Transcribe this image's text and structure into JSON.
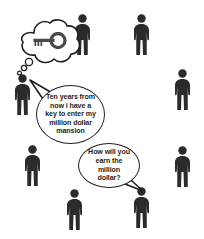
{
  "scene": {
    "title": "Crowd of people with thought and speech bubbles",
    "background_color": "#ffffff",
    "figure_color": "#2b2b2b",
    "outline_color": "#231f20",
    "width": 204,
    "height": 239
  },
  "thought": {
    "speaker": "man-left",
    "icon": "key-icon",
    "bubble_type": "thought-cloud",
    "trail_dots": 3
  },
  "bubbles": [
    {
      "id": "bubble-1",
      "text": "Ten years from now i have a key to enter my million dollar mansion",
      "speaker": "man-left",
      "tail_direction": "up-left"
    },
    {
      "id": "bubble-2",
      "text": "How will you earn the million dollar?",
      "speaker": "man-bottom-right",
      "tail_direction": "down-right"
    }
  ],
  "figures": [
    {
      "name": "man-top-center",
      "x": 72,
      "y": 14,
      "w": 21,
      "h": 42
    },
    {
      "name": "man-top-right",
      "x": 131,
      "y": 14,
      "w": 21,
      "h": 42
    },
    {
      "name": "man-left",
      "x": 12,
      "y": 74,
      "w": 21,
      "h": 42
    },
    {
      "name": "man-right-upper",
      "x": 172,
      "y": 69,
      "w": 21,
      "h": 42
    },
    {
      "name": "man-lower-left",
      "x": 22,
      "y": 145,
      "w": 21,
      "h": 42
    },
    {
      "name": "man-right-lower",
      "x": 172,
      "y": 146,
      "w": 21,
      "h": 42
    },
    {
      "name": "man-bottom-left",
      "x": 64,
      "y": 189,
      "w": 21,
      "h": 42
    },
    {
      "name": "man-bottom-right",
      "x": 131,
      "y": 187,
      "w": 21,
      "h": 42
    }
  ]
}
